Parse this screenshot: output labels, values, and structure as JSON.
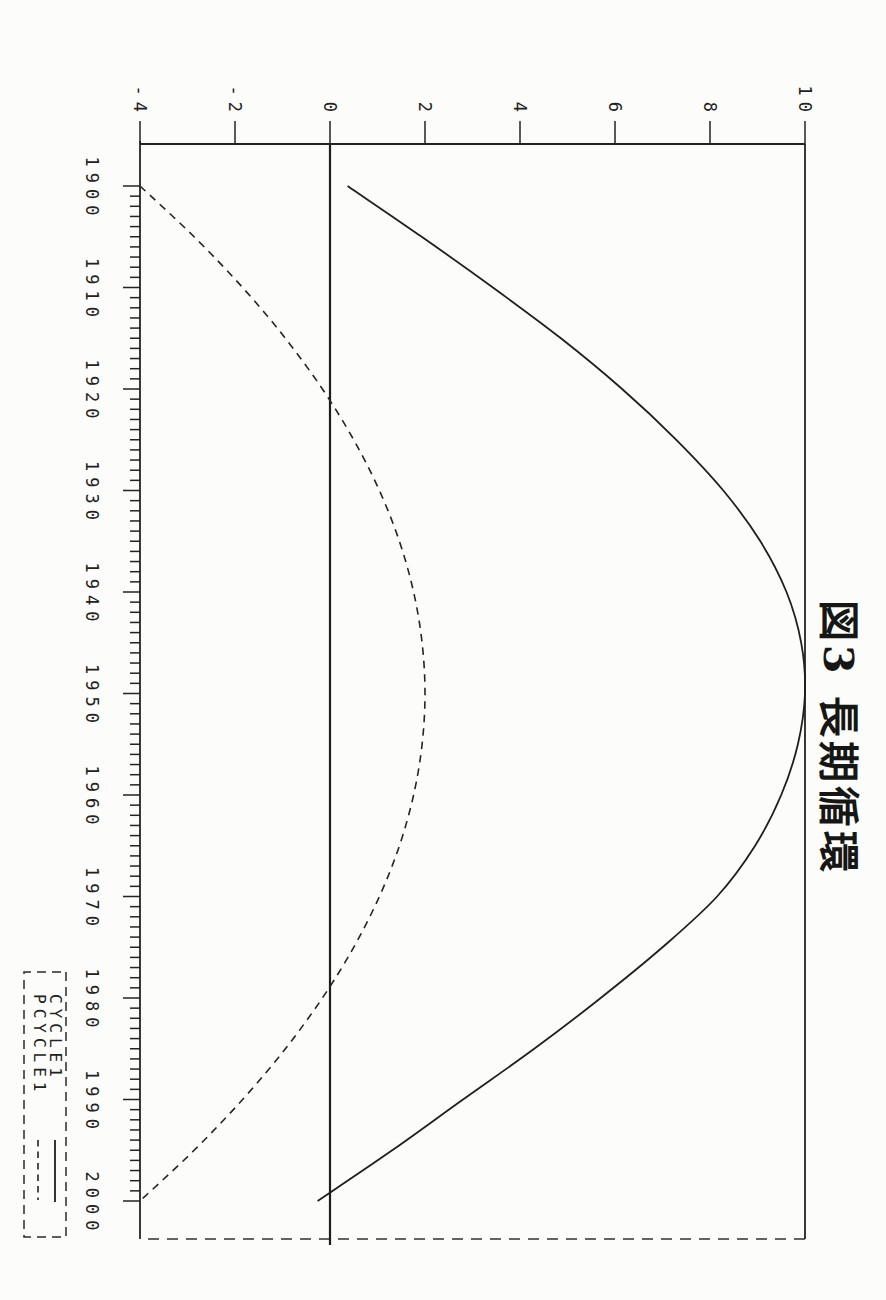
{
  "figure": {
    "title": "図3 長期循環",
    "orientation": "rotated-90-clockwise"
  },
  "chart_data": {
    "type": "line",
    "title": "図3 長期循環",
    "x": [
      1900,
      1905,
      1910,
      1915,
      1920,
      1925,
      1930,
      1935,
      1940,
      1945,
      1950,
      1955,
      1960,
      1965,
      1970,
      1975,
      1980,
      1985,
      1990,
      1995,
      2000
    ],
    "series": [
      {
        "name": "CYCLE1",
        "style": "solid",
        "values": [
          0.37,
          1.93,
          3.43,
          4.86,
          6.15,
          7.29,
          8.28,
          9.06,
          9.61,
          9.92,
          10.0,
          9.85,
          9.5,
          8.95,
          8.15,
          7.0,
          5.7,
          4.3,
          2.8,
          1.31,
          -0.26
        ]
      },
      {
        "name": "PCYCLE1",
        "style": "dashed",
        "values": [
          -4.0,
          -2.86,
          -1.84,
          -0.94,
          -0.16,
          0.5,
          1.04,
          1.46,
          1.76,
          1.94,
          2.0,
          1.94,
          1.76,
          1.46,
          1.04,
          0.5,
          -0.16,
          -0.94,
          -1.84,
          -2.86,
          -4.0
        ]
      }
    ],
    "xlim": [
      1900,
      2000
    ],
    "ylim": [
      -4,
      10
    ],
    "xticks": [
      1900,
      1910,
      1920,
      1930,
      1940,
      1950,
      1960,
      1970,
      1980,
      1990,
      2000
    ],
    "xtick_minor_step": 1,
    "yticks": [
      -4,
      -2,
      0,
      2,
      4,
      6,
      8,
      10
    ],
    "grid": false,
    "zero_line": true,
    "legend": {
      "position": "bottom-right",
      "entries": [
        {
          "label": "CYCLE1",
          "line": "solid"
        },
        {
          "label": "PCYCLE1",
          "line": "dashed"
        }
      ]
    }
  },
  "colors": {
    "ink": "#222220",
    "paper": "#fcfcfa"
  }
}
